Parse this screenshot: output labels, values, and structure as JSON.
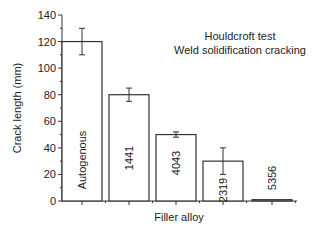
{
  "chart_data": {
    "type": "bar",
    "title": "Houldcroft test",
    "subtitle": "Weld solidification cracking",
    "xlabel": "Filler alloy",
    "ylabel": "Crack length (mm)",
    "ylim": [
      0,
      140
    ],
    "yticks": [
      0,
      20,
      40,
      60,
      80,
      100,
      120,
      140
    ],
    "categories": [
      "Autogenous",
      "1441",
      "4043",
      "2319",
      "5356"
    ],
    "values": [
      120,
      80,
      50,
      30,
      1
    ],
    "errors": [
      10,
      5,
      2,
      10,
      0
    ],
    "grid": false,
    "legend": "none",
    "bar_labels_rotated": true
  },
  "colors": {
    "bar_fill": "#ffffff",
    "bar_stroke": "#333333",
    "axis": "#333333",
    "text": "#222222"
  }
}
